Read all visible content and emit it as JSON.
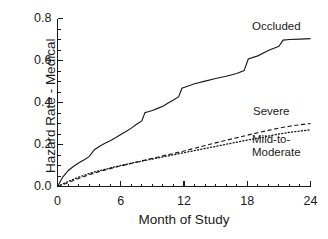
{
  "chart_data": {
    "type": "line",
    "title": "",
    "xlabel": "Month of Study",
    "ylabel": "Hazard Rate - Medical",
    "xlim": [
      0,
      24
    ],
    "ylim": [
      0,
      0.8
    ],
    "grid": false,
    "legend_position": "inline-annotations",
    "xticks": [
      "0",
      "6",
      "12",
      "18",
      "24"
    ],
    "xtick_values": [
      0,
      6,
      12,
      18,
      24
    ],
    "xminor_step": 1,
    "yticks": [
      "0.0",
      "0.2",
      "0.4",
      "0.6",
      "0.8"
    ],
    "ytick_values": [
      0.0,
      0.2,
      0.4,
      0.6,
      0.8
    ],
    "yminor_step": 0.05,
    "series": [
      {
        "name": "Occluded",
        "style": "solid",
        "x": [
          0,
          0.5,
          1,
          1.5,
          2,
          2.5,
          3,
          3.5,
          4,
          4.5,
          5,
          5.5,
          6,
          6.5,
          7,
          7.5,
          8,
          8.3,
          8.6,
          9,
          9.5,
          10,
          10.5,
          11,
          11.5,
          11.8,
          12.2,
          13,
          14,
          15,
          16,
          17,
          17.7,
          18.1,
          19,
          20,
          21,
          21.4,
          22,
          23,
          24
        ],
        "y": [
          0.0,
          0.045,
          0.075,
          0.095,
          0.112,
          0.126,
          0.142,
          0.175,
          0.192,
          0.206,
          0.218,
          0.232,
          0.248,
          0.262,
          0.278,
          0.296,
          0.312,
          0.352,
          0.356,
          0.362,
          0.372,
          0.382,
          0.398,
          0.412,
          0.428,
          0.468,
          0.475,
          0.489,
          0.502,
          0.514,
          0.525,
          0.538,
          0.552,
          0.607,
          0.622,
          0.648,
          0.668,
          0.697,
          0.7,
          0.702,
          0.704
        ]
      },
      {
        "name": "Severe",
        "style": "dashed",
        "x": [
          0,
          1,
          2,
          3,
          4,
          5,
          6,
          7,
          8,
          9,
          10,
          11,
          12,
          13,
          14,
          15,
          16,
          17,
          18,
          19,
          20,
          21,
          22,
          23,
          24
        ],
        "y": [
          0.0,
          0.018,
          0.038,
          0.056,
          0.072,
          0.085,
          0.098,
          0.11,
          0.122,
          0.134,
          0.146,
          0.157,
          0.169,
          0.182,
          0.195,
          0.208,
          0.22,
          0.232,
          0.244,
          0.256,
          0.267,
          0.278,
          0.287,
          0.294,
          0.3
        ]
      },
      {
        "name": "Mild-to-Moderate",
        "style": "dotted",
        "x": [
          0,
          1,
          2,
          3,
          4,
          5,
          6,
          7,
          8,
          9,
          10,
          11,
          12,
          13,
          14,
          15,
          16,
          17,
          18,
          19,
          20,
          21,
          22,
          23,
          24
        ],
        "y": [
          0.0,
          0.024,
          0.044,
          0.062,
          0.076,
          0.088,
          0.1,
          0.111,
          0.121,
          0.131,
          0.141,
          0.151,
          0.161,
          0.171,
          0.181,
          0.191,
          0.201,
          0.211,
          0.221,
          0.23,
          0.24,
          0.25,
          0.258,
          0.264,
          0.27
        ]
      }
    ],
    "annotations": [
      {
        "id": "occluded",
        "text": "Occluded",
        "series": "Occluded"
      },
      {
        "id": "severe",
        "text": "Severe",
        "series": "Severe"
      },
      {
        "id": "mild",
        "line1": "Mild-to-",
        "line2": "Moderate",
        "series": "Mild-to-Moderate"
      }
    ],
    "colors": {
      "axis": "#1a1a1a",
      "line": "#1a1a1a",
      "background": "#ffffff"
    }
  }
}
